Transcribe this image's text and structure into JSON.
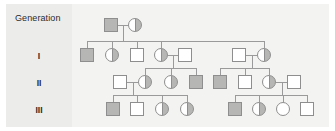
{
  "figure": {
    "kind": "pedigree-chart",
    "width": 335,
    "height": 131,
    "background": "#ffffff",
    "plate_color": "#ececeb",
    "panel_color": "#f3f3f2",
    "line_color": "#9a9a9a",
    "symbol_border_color": "#8e8e8e",
    "shaded_color": "#b6b6b4",
    "unshaded_color": "#ffffff"
  },
  "legend": {
    "title": "Generation",
    "rows": [
      {
        "label": "I",
        "top": 47
      },
      {
        "label": "II",
        "top": 74
      },
      {
        "label": "III",
        "top": 101
      }
    ]
  },
  "chart_data": {
    "type": "pedigree",
    "title": "Generation",
    "generation_labels": [
      "I",
      "II",
      "III"
    ],
    "symbol_key": {
      "square": "male",
      "circle": "female",
      "full": "affected",
      "half": "carrier",
      "none": "unaffected"
    },
    "generations": [
      {
        "label": "P",
        "y": 18,
        "individuals": [
          {
            "id": "P-1",
            "shape": "square",
            "fill": "full",
            "sex": "male",
            "status": "affected",
            "x": 104
          },
          {
            "id": "P-2",
            "shape": "circle",
            "fill": "half",
            "sex": "female",
            "status": "carrier",
            "x": 128
          }
        ]
      },
      {
        "label": "I",
        "y": 48,
        "individuals": [
          {
            "id": "I-1",
            "shape": "square",
            "fill": "full",
            "sex": "male",
            "status": "affected",
            "x": 80
          },
          {
            "id": "I-2",
            "shape": "circle",
            "fill": "half",
            "sex": "female",
            "status": "carrier",
            "x": 105
          },
          {
            "id": "I-3",
            "shape": "square",
            "fill": "none",
            "sex": "male",
            "status": "unaffected",
            "x": 130
          },
          {
            "id": "I-4",
            "shape": "circle",
            "fill": "half",
            "sex": "female",
            "status": "carrier",
            "x": 154
          },
          {
            "id": "I-5",
            "shape": "square",
            "fill": "none",
            "sex": "male",
            "status": "unaffected",
            "x": 178
          },
          {
            "id": "I-6",
            "shape": "square",
            "fill": "none",
            "sex": "male",
            "status": "unaffected",
            "x": 232
          },
          {
            "id": "I-7",
            "shape": "circle",
            "fill": "half",
            "sex": "female",
            "status": "carrier",
            "x": 257
          }
        ]
      },
      {
        "label": "II",
        "y": 75,
        "individuals": [
          {
            "id": "II-1",
            "shape": "square",
            "fill": "none",
            "sex": "male",
            "status": "unaffected",
            "x": 113
          },
          {
            "id": "II-2",
            "shape": "circle",
            "fill": "half",
            "sex": "female",
            "status": "carrier",
            "x": 138
          },
          {
            "id": "II-3",
            "shape": "circle",
            "fill": "half",
            "sex": "female",
            "status": "carrier",
            "x": 164
          },
          {
            "id": "II-4",
            "shape": "square",
            "fill": "full",
            "sex": "male",
            "status": "affected",
            "x": 189
          },
          {
            "id": "II-5",
            "shape": "square",
            "fill": "full",
            "sex": "male",
            "status": "affected",
            "x": 213
          },
          {
            "id": "II-6",
            "shape": "square",
            "fill": "none",
            "sex": "male",
            "status": "unaffected",
            "x": 238
          },
          {
            "id": "II-7",
            "shape": "circle",
            "fill": "half",
            "sex": "female",
            "status": "carrier",
            "x": 262
          },
          {
            "id": "II-8",
            "shape": "square",
            "fill": "none",
            "sex": "male",
            "status": "unaffected",
            "x": 287
          }
        ]
      },
      {
        "label": "III",
        "y": 102,
        "individuals": [
          {
            "id": "III-1",
            "shape": "square",
            "fill": "full",
            "sex": "male",
            "status": "affected",
            "x": 106
          },
          {
            "id": "III-2",
            "shape": "square",
            "fill": "none",
            "sex": "male",
            "status": "unaffected",
            "x": 130
          },
          {
            "id": "III-3",
            "shape": "circle",
            "fill": "half",
            "sex": "female",
            "status": "carrier",
            "x": 155
          },
          {
            "id": "III-4",
            "shape": "circle",
            "fill": "half",
            "sex": "female",
            "status": "carrier",
            "x": 180
          },
          {
            "id": "III-5",
            "shape": "square",
            "fill": "full",
            "sex": "male",
            "status": "affected",
            "x": 228
          },
          {
            "id": "III-6",
            "shape": "circle",
            "fill": "half",
            "sex": "female",
            "status": "carrier",
            "x": 252
          },
          {
            "id": "III-7",
            "shape": "circle",
            "fill": "none",
            "sex": "female",
            "status": "unaffected",
            "x": 276
          },
          {
            "id": "III-8",
            "shape": "square",
            "fill": "none",
            "sex": "male",
            "status": "unaffected",
            "x": 300
          }
        ]
      }
    ],
    "matings": [
      {
        "partners": [
          "P-1",
          "P-2"
        ],
        "children": [
          "I-1",
          "I-2",
          "I-3",
          "I-4",
          "I-7"
        ]
      },
      {
        "partners": [
          "I-4",
          "I-5"
        ],
        "children": [
          "II-2",
          "II-3",
          "II-4"
        ]
      },
      {
        "partners": [
          "I-6",
          "I-7"
        ],
        "children": [
          "II-5",
          "II-6",
          "II-7"
        ]
      },
      {
        "partners": [
          "II-1",
          "II-2"
        ],
        "children": [
          "III-1",
          "III-2",
          "III-3",
          "III-4"
        ]
      },
      {
        "partners": [
          "II-7",
          "II-8"
        ],
        "children": [
          "III-5",
          "III-6",
          "III-7",
          "III-8"
        ]
      }
    ]
  }
}
